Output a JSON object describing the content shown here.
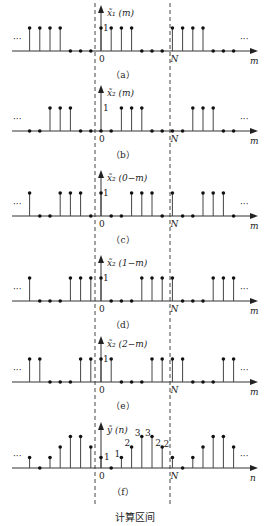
{
  "layout": {
    "origin_x": 101,
    "spacing": 10.2,
    "period_N": 7,
    "unit_height": 10.5,
    "n_min": -7,
    "n_max": 13,
    "dashed_left_x": 95,
    "dashed_right_x": 170
  },
  "panels": [
    {
      "id": "a",
      "baseline": 51,
      "ylabel": "x̃₁ (m)",
      "axis_var": "m",
      "caption": "（a）",
      "period_values": [
        1,
        1,
        1,
        1,
        0,
        0,
        0
      ],
      "value_labels": [],
      "one_label": "1"
    },
    {
      "id": "b",
      "baseline": 131,
      "ylabel": "x̃₂ (m)",
      "axis_var": "m",
      "caption": "（b）",
      "period_values": [
        0,
        0,
        1,
        1,
        1,
        0,
        0
      ],
      "value_labels": [],
      "one_label": "1"
    },
    {
      "id": "c",
      "baseline": 216,
      "ylabel": "x̃₂ (0−m)",
      "axis_var": "m",
      "caption": "（c）",
      "period_values": [
        1,
        0,
        0,
        1,
        1,
        1,
        0
      ],
      "value_labels": [],
      "one_label": "1"
    },
    {
      "id": "d",
      "baseline": 301,
      "ylabel": "x̃₂ (1−m)",
      "axis_var": "m",
      "caption": "（d）",
      "period_values": [
        1,
        0,
        0,
        0,
        1,
        1,
        1
      ],
      "value_labels": [],
      "one_label": "1"
    },
    {
      "id": "e",
      "baseline": 382,
      "ylabel": "x̃₂ (2−m)",
      "axis_var": "m",
      "caption": "（e）",
      "period_values": [
        1,
        1,
        0,
        0,
        0,
        1,
        1
      ],
      "value_labels": [],
      "one_label": "1"
    },
    {
      "id": "f",
      "baseline": 468,
      "ylabel": "ỹ (n)",
      "axis_var": "n",
      "caption": "（f）",
      "period_values": [
        1,
        0,
        1,
        2,
        3,
        3,
        2
      ],
      "value_labels": [
        "1",
        "",
        "1",
        "2",
        "3",
        "3",
        "2"
      ],
      "one_label": ""
    }
  ],
  "labels": {
    "zero": "0",
    "N": "N",
    "ellipsis": "···",
    "footer": "计算区间"
  },
  "chart_data": {
    "type": "stem",
    "period_N": 7,
    "series": [
      {
        "name": "x̃1(m)",
        "one_period": [
          1,
          1,
          1,
          1,
          0,
          0,
          0
        ]
      },
      {
        "name": "x̃2(m)",
        "one_period": [
          0,
          0,
          1,
          1,
          1,
          0,
          0
        ]
      },
      {
        "name": "x̃2(0−m)",
        "one_period": [
          1,
          0,
          0,
          1,
          1,
          1,
          0
        ]
      },
      {
        "name": "x̃2(1−m)",
        "one_period": [
          1,
          0,
          0,
          0,
          1,
          1,
          1
        ]
      },
      {
        "name": "x̃2(2−m)",
        "one_period": [
          1,
          1,
          0,
          0,
          0,
          1,
          1
        ]
      },
      {
        "name": "ỹ(n)",
        "one_period": [
          1,
          0,
          1,
          2,
          3,
          3,
          2
        ]
      }
    ],
    "xlabel": "m / n",
    "annotation": "计算区间 (computation interval 0..N−1)"
  }
}
